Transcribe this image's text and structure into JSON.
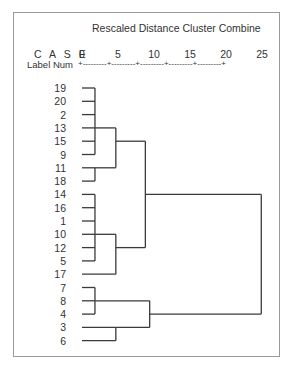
{
  "chart_data": {
    "type": "dendrogram",
    "title": "Rescaled Distance Cluster Combine",
    "header": {
      "case_label": "C A S E",
      "label_num": "Label  Num"
    },
    "axis": {
      "ticks": [
        0,
        5,
        10,
        15,
        20,
        25
      ],
      "tick_labels": [
        "0",
        "5",
        "10",
        "15",
        "20",
        "25"
      ],
      "range": [
        0,
        25
      ],
      "axis_text": "+---------+---------+---------+---------+---------+"
    },
    "leaves": [
      "19",
      "20",
      "2",
      "13",
      "15",
      "9",
      "11",
      "18",
      "14",
      "16",
      "1",
      "10",
      "12",
      "5",
      "17",
      "7",
      "8",
      "4",
      "3",
      "6"
    ],
    "merges": [
      {
        "members": [
          "19",
          "20",
          "2",
          "13",
          "15",
          "9"
        ],
        "distance": 1.8
      },
      {
        "members": [
          "11",
          "18"
        ],
        "distance": 1.8
      },
      {
        "members": [
          "19-9 cluster",
          "11-18 cluster"
        ],
        "distance": 4.7
      },
      {
        "members": [
          "14",
          "16",
          "1",
          "10",
          "12",
          "5"
        ],
        "distance": 1.8
      },
      {
        "members": [
          "14-5 cluster",
          "17"
        ],
        "distance": 4.7
      },
      {
        "members": [
          "19-18 cluster",
          "14-17 cluster"
        ],
        "distance": 8.8
      },
      {
        "members": [
          "7",
          "8",
          "4"
        ],
        "distance": 1.8
      },
      {
        "members": [
          "3",
          "6"
        ],
        "distance": 4.7
      },
      {
        "members": [
          "7-4 cluster",
          "3-6 cluster"
        ],
        "distance": 9.4
      },
      {
        "members": [
          "19-17 cluster",
          "7-6 cluster"
        ],
        "distance": 24.9
      }
    ],
    "xlabel": "Rescaled Distance Cluster Combine",
    "ylabel": "CASE Label Num",
    "grid": false
  },
  "colors": {
    "line": "#3a3a3a",
    "frame": "#9a9a9a",
    "text": "#333333"
  }
}
